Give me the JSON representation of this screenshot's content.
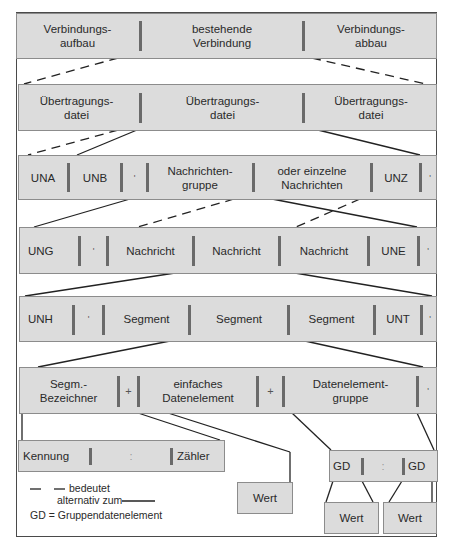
{
  "diagram": {
    "rows": [
      {
        "id": "row1",
        "cells": [
          "Verbindungs-\naufbau",
          "bestehende\nVerbindung",
          "Verbindungs-\nabbau"
        ]
      },
      {
        "id": "row2",
        "cells": [
          "Übertragungs-\ndatei",
          "Übertragungs-\ndatei",
          "Übertragungs-\ndatei"
        ]
      },
      {
        "id": "row3",
        "cells": [
          "UNA",
          "UNB",
          "'",
          "Nachrichten-\ngruppe",
          "oder einzelne\nNachrichten",
          "UNZ",
          "'"
        ]
      },
      {
        "id": "row4",
        "cells": [
          "UNG",
          "'",
          "Nachricht",
          "Nachricht",
          "Nachricht",
          "UNE",
          "'"
        ]
      },
      {
        "id": "row5",
        "cells": [
          "UNH",
          "'",
          "Segment",
          "Segment",
          "Segment",
          "UNT",
          "'"
        ]
      },
      {
        "id": "row6",
        "cells": [
          "Segm.-\nBezeichner",
          "+",
          "einfaches\nDatenelement",
          "+",
          "Datenelement-\ngruppe",
          "'"
        ]
      }
    ],
    "kennung_box": {
      "cells": [
        "Kennung",
        ":",
        "Zähler"
      ]
    },
    "wert_single": "Wert",
    "gd_box": {
      "cells": [
        "GD",
        ":",
        "GD"
      ]
    },
    "wert_left": "Wert",
    "wert_right": "Wert",
    "legend": {
      "line1": "bedeutet",
      "line2": "alternativ zum",
      "line3": "GD = Gruppendatenelement"
    }
  },
  "colors": {
    "box_fill": "#dcdcdc",
    "separator": "#6a6a6a",
    "line": "#2a2a2a"
  }
}
